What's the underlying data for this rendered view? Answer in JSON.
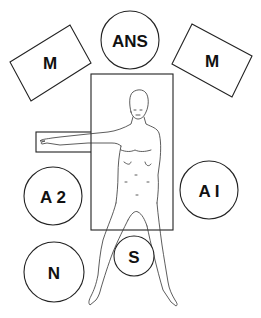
{
  "diagram": {
    "table": {
      "label": "operating-table"
    },
    "arm_board": {
      "label": "arm-board"
    },
    "stations": [
      {
        "id": "monitor-left",
        "label": "M",
        "shape": "rectangle"
      },
      {
        "id": "anesthesia",
        "label": "ANS",
        "shape": "circle"
      },
      {
        "id": "monitor-right",
        "label": "M",
        "shape": "rectangle"
      },
      {
        "id": "assistant-2",
        "label": "A 2",
        "shape": "circle"
      },
      {
        "id": "assistant-1",
        "label": "A I",
        "shape": "circle"
      },
      {
        "id": "nurse",
        "label": "N",
        "shape": "circle"
      },
      {
        "id": "surgeon",
        "label": "S",
        "shape": "circle"
      }
    ],
    "patient": {
      "description": "supine patient, left arm abducted on arm board, legs spread"
    },
    "colors": {
      "line": "#222222",
      "background": "#ffffff"
    }
  }
}
